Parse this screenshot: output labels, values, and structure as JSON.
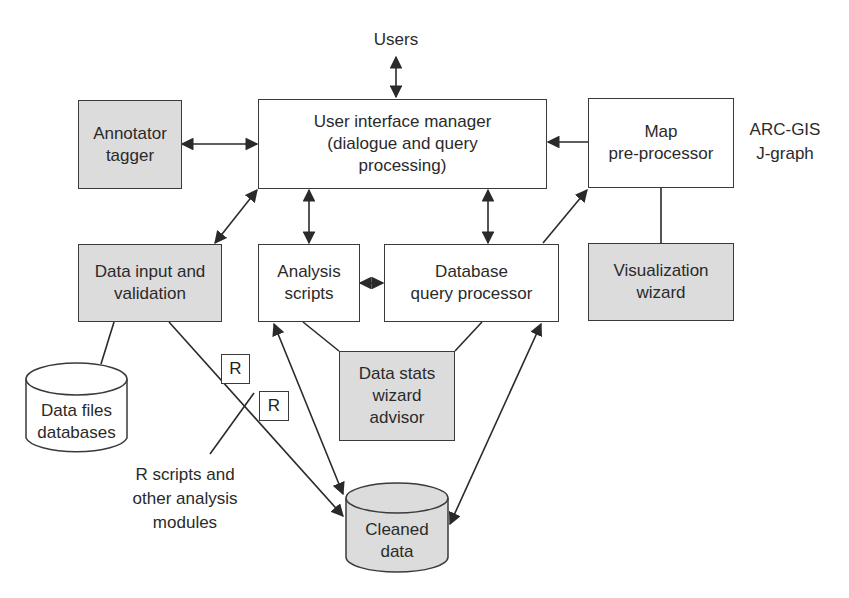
{
  "diagram": {
    "colors": {
      "line": "#2a2a2a",
      "shaded_fill": "#dcdcdc",
      "plain_fill": "#ffffff"
    },
    "nodes": {
      "users": {
        "label": "Users"
      },
      "ui_manager": {
        "lines": [
          "User interface manager",
          "(dialogue and query",
          "processing)"
        ]
      },
      "annotator": {
        "lines": [
          "Annotator",
          "tagger"
        ]
      },
      "map_preprocessor": {
        "lines": [
          "Map",
          "pre-processor"
        ]
      },
      "arcgis": {
        "lines": [
          "ARC-GIS",
          "J-graph"
        ]
      },
      "data_input": {
        "lines": [
          "Data input and",
          "validation"
        ]
      },
      "analysis_scripts": {
        "lines": [
          "Analysis",
          "scripts"
        ]
      },
      "db_query": {
        "lines": [
          "Database",
          "query processor"
        ]
      },
      "visualization": {
        "lines": [
          "Visualization",
          "wizard"
        ]
      },
      "data_files": {
        "lines": [
          "Data files",
          "databases"
        ]
      },
      "data_stats": {
        "lines": [
          "Data stats",
          "wizard",
          "advisor"
        ]
      },
      "r_box_1": {
        "label": "R"
      },
      "r_box_2": {
        "label": "R"
      },
      "r_scripts_note": {
        "lines": [
          "R scripts and",
          "other analysis",
          "modules"
        ]
      },
      "cleaned_data": {
        "lines": [
          "Cleaned",
          "data"
        ]
      }
    },
    "edges": [
      {
        "from": "users",
        "to": "ui_manager",
        "type": "bidirectional"
      },
      {
        "from": "annotator",
        "to": "ui_manager",
        "type": "bidirectional"
      },
      {
        "from": "map_preprocessor",
        "to": "ui_manager",
        "type": "directed"
      },
      {
        "from": "data_input",
        "to": "ui_manager",
        "type": "bidirectional"
      },
      {
        "from": "analysis_scripts",
        "to": "ui_manager",
        "type": "bidirectional"
      },
      {
        "from": "db_query",
        "to": "ui_manager",
        "type": "bidirectional"
      },
      {
        "from": "analysis_scripts",
        "to": "db_query",
        "type": "bidirectional"
      },
      {
        "from": "db_query",
        "to": "map_preprocessor",
        "type": "directed"
      },
      {
        "from": "map_preprocessor",
        "to": "visualization",
        "type": "line"
      },
      {
        "from": "data_input",
        "to": "data_files",
        "type": "line"
      },
      {
        "from": "data_input",
        "to": "cleaned_data",
        "type": "directed"
      },
      {
        "from": "analysis_scripts",
        "to": "cleaned_data",
        "type": "bidirectional"
      },
      {
        "from": "db_query",
        "to": "cleaned_data",
        "type": "bidirectional"
      },
      {
        "from": "analysis_scripts",
        "to": "data_stats",
        "type": "line"
      },
      {
        "from": "db_query",
        "to": "data_stats",
        "type": "line"
      },
      {
        "from": "r_scripts_note",
        "to": "r_box_2",
        "type": "line"
      }
    ]
  }
}
